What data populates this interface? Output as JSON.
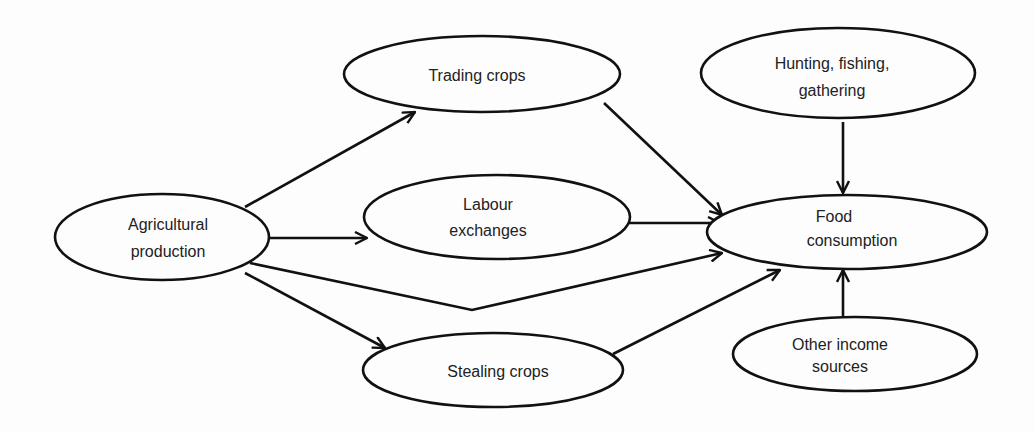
{
  "diagram": {
    "type": "flow",
    "nodes": [
      {
        "id": "agri",
        "lines": [
          "Agricultural",
          "production"
        ],
        "cx": 162,
        "cy": 237,
        "rx": 107,
        "ry": 43
      },
      {
        "id": "trading",
        "lines": [
          "Trading crops"
        ],
        "cx": 482,
        "cy": 74,
        "rx": 138,
        "ry": 38
      },
      {
        "id": "labour",
        "lines": [
          "Labour",
          "exchanges"
        ],
        "cx": 497,
        "cy": 217,
        "rx": 133,
        "ry": 42
      },
      {
        "id": "stealing",
        "lines": [
          "Stealing crops"
        ],
        "cx": 493,
        "cy": 370,
        "rx": 130,
        "ry": 37
      },
      {
        "id": "hunting",
        "lines": [
          "Hunting, fishing,",
          "gathering"
        ],
        "cx": 838,
        "cy": 73,
        "rx": 137,
        "ry": 45
      },
      {
        "id": "food",
        "lines": [
          "Food",
          "consumption"
        ],
        "cx": 847,
        "cy": 232,
        "rx": 140,
        "ry": 37
      },
      {
        "id": "other",
        "lines": [
          "Other income",
          "sources"
        ],
        "cx": 855,
        "cy": 354,
        "rx": 122,
        "ry": 37
      }
    ],
    "edges": [
      {
        "from": "agri",
        "to": "trading"
      },
      {
        "from": "agri",
        "to": "labour"
      },
      {
        "from": "agri",
        "to": "food",
        "direct": true
      },
      {
        "from": "agri",
        "to": "stealing"
      },
      {
        "from": "trading",
        "to": "food"
      },
      {
        "from": "labour",
        "to": "food"
      },
      {
        "from": "stealing",
        "to": "food"
      },
      {
        "from": "hunting",
        "to": "food"
      },
      {
        "from": "other",
        "to": "food"
      }
    ]
  }
}
